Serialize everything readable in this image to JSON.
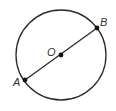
{
  "diagram": {
    "type": "circle-with-diameter",
    "colors": {
      "stroke": "#2b2b2b",
      "point": "#111111",
      "label": "#333333",
      "background": "#ffffff"
    },
    "circle": {
      "cx": 61,
      "cy": 55,
      "r": 45
    },
    "points": [
      {
        "id": "A",
        "label": "A",
        "x": 25,
        "y": 80,
        "label_x": 13,
        "label_y": 86
      },
      {
        "id": "O",
        "label": "O",
        "x": 61,
        "y": 55,
        "label_x": 47,
        "label_y": 56
      },
      {
        "id": "B",
        "label": "B",
        "x": 97,
        "y": 28,
        "label_x": 100,
        "label_y": 26
      }
    ],
    "segment": {
      "from": "A",
      "to": "B",
      "through": "O",
      "name": "diameter AB"
    }
  }
}
